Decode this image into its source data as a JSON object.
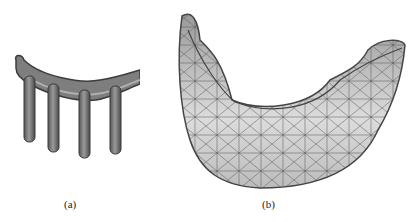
{
  "figure": {
    "panels": [
      {
        "label": "(a)",
        "description": "3D model of implant bar with four posts"
      },
      {
        "label": "(b)",
        "description": "triangulated wireframe mesh of denture base"
      }
    ]
  }
}
